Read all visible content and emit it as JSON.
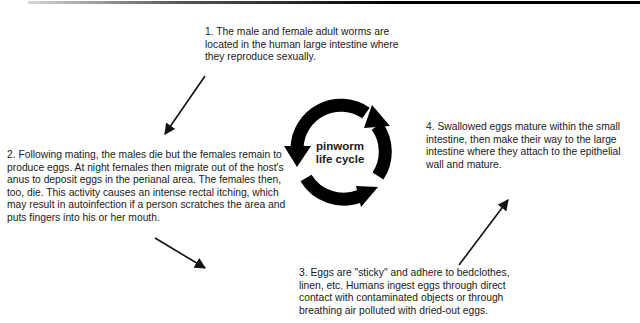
{
  "diagram": {
    "title": "pinworm life cycle",
    "center_label": {
      "line1": "pinworm",
      "line2": "life cycle"
    },
    "steps": [
      {
        "number": "1.",
        "text": "1.  The male and female adult worms are located in the human large intestine where they reproduce sexually."
      },
      {
        "number": "2.",
        "text": "2.  Following mating, the males die but the females remain to produce eggs. At night females then migrate out of the host's anus to deposit eggs in the perianal area. The females then, too, die.  This activity causes an intense rectal itching, which may result in autoinfection if a person scratches the area and puts fingers into his or her mouth."
      },
      {
        "number": "3.",
        "text": "3.  Eggs are \"sticky\" and adhere to bedclothes, linen, etc. Humans ingest eggs through direct contact with contaminated objects or through breathing air polluted with dried-out eggs."
      },
      {
        "number": "4.",
        "text": "4.  Swallowed eggs mature within the small intestine, then make their way to the large intestine where they attach to the epithelial wall and mature."
      }
    ],
    "arrows": [
      {
        "from": "step-1",
        "to": "step-2",
        "direction": "down-left"
      },
      {
        "from": "step-2",
        "to": "step-3",
        "direction": "down-right"
      },
      {
        "from": "step-3",
        "to": "step-4",
        "direction": "up-right"
      }
    ],
    "colors": {
      "ink": "#000000",
      "text": "#1a1a1a",
      "background": "#ffffff"
    }
  }
}
